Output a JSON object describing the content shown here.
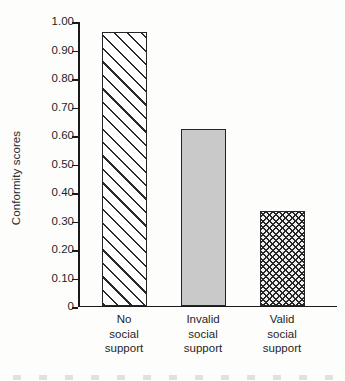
{
  "chart_data": {
    "type": "bar",
    "title": "",
    "subtitle": "",
    "xlabel": "",
    "ylabel": "Conformity scores",
    "categories": [
      "No social support",
      "Invalid social support",
      "Valid social support"
    ],
    "category_lines": [
      [
        "No",
        "social",
        "support"
      ],
      [
        "Invalid",
        "social",
        "support"
      ],
      [
        "Valid",
        "social",
        "support"
      ]
    ],
    "values": [
      0.96,
      0.62,
      0.33
    ],
    "ylim": [
      0,
      1.0
    ],
    "ytick_values": [
      1.0,
      0.9,
      0.8,
      0.7,
      0.6,
      0.5,
      0.4,
      0.3,
      0.2,
      0.1,
      0
    ],
    "ytick_labels": [
      "1.00",
      "0.90",
      "0.80",
      "0.70",
      "0.60",
      "0.50",
      "0.40",
      "0.30",
      "0.20",
      "0.10",
      "0"
    ],
    "grid": false,
    "legend": false,
    "legend_position": "none",
    "bar_fills": [
      "diagonal-hatch",
      "solid-gray",
      "cross-hatch"
    ],
    "colors": {
      "axis": "#1a1a1a",
      "bar_outline": "#242424",
      "hatch": "#2a2a2a",
      "solid_gray": "#c9c9c9",
      "background": "#fdfdfc",
      "text": "#1f1f1f"
    }
  }
}
